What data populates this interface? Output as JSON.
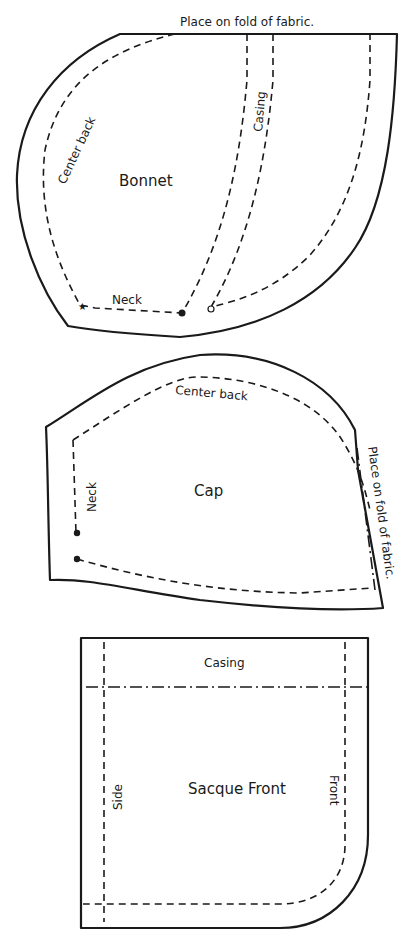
{
  "pieces": {
    "bonnet": {
      "title": "Bonnet",
      "fold_label": "Place on fold of fabric.",
      "center_back_label": "Center back",
      "casing_label": "Casing",
      "neck_label": "Neck",
      "markers": [
        "star",
        "filled-dot",
        "open-circle"
      ]
    },
    "cap": {
      "title": "Cap",
      "center_back_label": "Center back",
      "neck_label": "Neck",
      "fold_label": "Place on fold of fabric.",
      "markers": [
        "filled-dot",
        "filled-dot"
      ]
    },
    "sacque_front": {
      "title": "Sacque Front",
      "casing_label": "Casing",
      "side_label": "Side",
      "front_label": "Front"
    }
  },
  "colors": {
    "ink": "#1a1a1a",
    "paper": "#ffffff"
  }
}
